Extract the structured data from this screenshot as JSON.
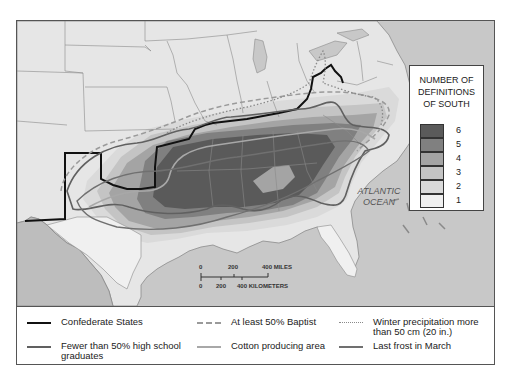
{
  "map": {
    "ocean_label_line1": "ATLANTIC",
    "ocean_label_line2": "OCEAN",
    "colors": {
      "ocean": "#c8c8c8",
      "land_outside": "#e6e6e6",
      "mexico": "#bdbdbd",
      "state_border": "#8a8a8a",
      "confederate_line": "#111111",
      "hs_line": "#606060",
      "baptist_line": "#9a9a9a",
      "precip_line": "#8a8a8a",
      "cotton_line": "#a8a8a8",
      "frost_line": "#707070"
    },
    "scale_bar": {
      "miles_ticks": [
        "0",
        "200",
        "400 MILES"
      ],
      "km_ticks": [
        "0",
        "200",
        "400 KILOMETERS"
      ]
    }
  },
  "choropleth_legend": {
    "title_line1": "NUMBER OF",
    "title_line2": "DEFINITIONS",
    "title_line3": "OF SOUTH",
    "classes": [
      {
        "value": "6",
        "color": "#5a5a5a"
      },
      {
        "value": "5",
        "color": "#808080"
      },
      {
        "value": "4",
        "color": "#a4a4a4"
      },
      {
        "value": "3",
        "color": "#c4c4c4"
      },
      {
        "value": "2",
        "color": "#dadada"
      },
      {
        "value": "1",
        "color": "#f0f0f0"
      }
    ]
  },
  "line_key": {
    "items": [
      {
        "label": "Confederate States",
        "style": "solid-black"
      },
      {
        "label": "At least 50% Baptist",
        "style": "dashed"
      },
      {
        "label_line1": "Winter precipitation more",
        "label_line2": "than 50 cm (20 in.)",
        "style": "dotted"
      },
      {
        "label_line1": "Fewer than 50% high school",
        "label_line2": "graduates",
        "style": "solid-dark-gray"
      },
      {
        "label": "Cotton producing area",
        "style": "solid-light-gray"
      },
      {
        "label": "Last frost in March",
        "style": "solid-medium-gray"
      }
    ]
  }
}
